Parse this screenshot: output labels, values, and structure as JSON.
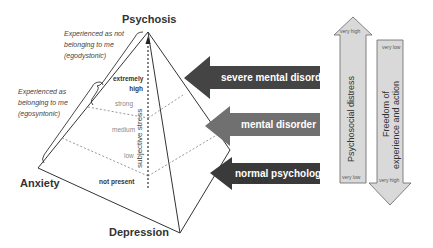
{
  "vertices": {
    "top": "Psychosis",
    "left": "Anxiety",
    "bottom": "Depression",
    "right": "Stress"
  },
  "annotations": {
    "egodystonic": [
      "Experienced as not",
      "belonging to me",
      "(egodystonic)"
    ],
    "egosyntonic": [
      "Experienced as",
      "belonging to me",
      "(egosyntonic)"
    ]
  },
  "axis": {
    "label": "subjective stress",
    "levels": [
      "extremely high",
      "strong",
      "medium",
      "low",
      "not present"
    ]
  },
  "arrows": [
    {
      "label": "severe mental disorder",
      "color": "#444444"
    },
    {
      "label": "mental disorder",
      "color": "#6e6e6e"
    },
    {
      "label": "normal psychological",
      "color": "#3a3a3a"
    }
  ],
  "side_arrows": {
    "distress": {
      "label": "Psychosocial distress",
      "top": "very high",
      "bottom": "very low",
      "direction": "up"
    },
    "freedom": {
      "label_line1": "Freedom of",
      "label_line2": "experience and action",
      "top": "very low",
      "bottom": "very high",
      "direction": "down"
    }
  },
  "colors": {
    "arrow_fill": "#d9d9d9",
    "line": "#333333",
    "dotted": "#999999"
  }
}
